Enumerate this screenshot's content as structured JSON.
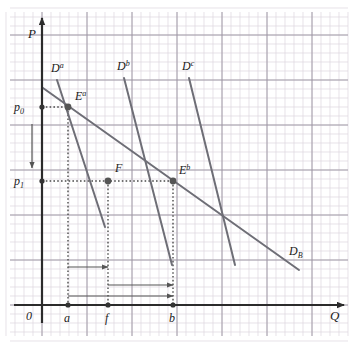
{
  "figure": {
    "background_color": "#ffffff",
    "width": 354,
    "height": 348
  },
  "grid": {
    "minor_color": "#dcd6de",
    "major_color": "#9a93a0",
    "minor_step": 9,
    "major_step": 45,
    "visible": true
  },
  "axes": {
    "color": "#2b2b2b",
    "origin": {
      "x": 42,
      "y": 305
    },
    "y_axis": {
      "label": "P",
      "label_x": 28,
      "label_y": 38,
      "top_y": 18
    },
    "x_axis": {
      "label": "Q",
      "label_x": 330,
      "label_y": 320,
      "right_x": 344
    },
    "origin_label": "0",
    "origin_label_x": 26,
    "origin_label_y": 320
  },
  "price_ticks": [
    {
      "name": "p0",
      "base": "p",
      "sub": "0",
      "y": 107,
      "label_x": 14,
      "label_y": 111
    },
    {
      "name": "p1",
      "base": "p",
      "sub": "1",
      "y": 181,
      "label_x": 14,
      "label_y": 185
    }
  ],
  "quantity_ticks": [
    {
      "name": "a",
      "label": "a",
      "x": 68,
      "label_x": 64,
      "label_y": 322
    },
    {
      "name": "f",
      "label": "f",
      "x": 108,
      "label_x": 105,
      "label_y": 322
    },
    {
      "name": "b",
      "label": "b",
      "x": 173,
      "label_x": 169,
      "label_y": 322
    }
  ],
  "curves": [
    {
      "id": "Da",
      "base": "D",
      "sup": "a",
      "label_x": 51,
      "label_y": 72,
      "color": "#6e6e76",
      "x1": 57,
      "y1": 80,
      "x2": 105,
      "y2": 227
    },
    {
      "id": "Db",
      "base": "D",
      "sup": "b",
      "label_x": 117,
      "label_y": 70,
      "color": "#6e6e76",
      "x1": 124,
      "y1": 78,
      "x2": 172,
      "y2": 265
    },
    {
      "id": "Dc",
      "base": "D",
      "sup": "c",
      "label_x": 182,
      "label_y": 70,
      "color": "#6e6e76",
      "x1": 189,
      "y1": 78,
      "x2": 235,
      "y2": 265
    },
    {
      "id": "DB",
      "base": "D",
      "sub": "B",
      "label_x": 289,
      "label_y": 255,
      "color": "#6e6e76",
      "x1": 43,
      "y1": 88,
      "x2": 299,
      "y2": 270
    }
  ],
  "points": [
    {
      "id": "Ea",
      "base": "E",
      "sup": "a",
      "x": 68,
      "y": 107,
      "label_x": 75,
      "label_y": 100
    },
    {
      "id": "F",
      "base": "F",
      "sup": "",
      "x": 108,
      "y": 181,
      "label_x": 115,
      "label_y": 172
    },
    {
      "id": "Eb",
      "base": "E",
      "sup": "b",
      "x": 173,
      "y": 181,
      "label_x": 179,
      "label_y": 174
    }
  ],
  "dotted_guides": {
    "color": "#4a4a4a",
    "lines": [
      {
        "name": "p0-to-Ea",
        "x1": 42,
        "y1": 107,
        "x2": 68,
        "y2": 107
      },
      {
        "name": "Ea-to-a",
        "x1": 68,
        "y1": 107,
        "x2": 68,
        "y2": 305
      },
      {
        "name": "p1-to-Eb",
        "x1": 42,
        "y1": 181,
        "x2": 173,
        "y2": 181
      },
      {
        "name": "F-to-f",
        "x1": 108,
        "y1": 181,
        "x2": 108,
        "y2": 305
      },
      {
        "name": "Eb-to-b",
        "x1": 173,
        "y1": 181,
        "x2": 173,
        "y2": 305
      }
    ]
  },
  "annotation_arrows": {
    "color": "#555555",
    "items": [
      {
        "name": "price-fall-arrow",
        "direction": "down",
        "x1": 32,
        "y1": 124,
        "x2": 32,
        "y2": 168
      },
      {
        "name": "a-to-f-arrow",
        "direction": "right",
        "x1": 68,
        "y1": 267,
        "x2": 108,
        "y2": 267
      },
      {
        "name": "f-to-b-arrow",
        "direction": "right",
        "x1": 108,
        "y1": 285,
        "x2": 173,
        "y2": 285
      },
      {
        "name": "a-to-b-arrow",
        "direction": "right",
        "x1": 68,
        "y1": 296,
        "x2": 173,
        "y2": 296
      }
    ]
  }
}
